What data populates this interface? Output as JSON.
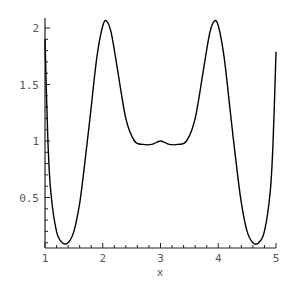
{
  "chart_data": {
    "type": "line",
    "title": "",
    "xlabel": "x",
    "ylabel": "",
    "xlim": [
      1,
      5
    ],
    "ylim": [
      0.05,
      2.1
    ],
    "grid": false,
    "legend": null,
    "x_ticks": [
      "1",
      "2",
      "3",
      "4",
      "5"
    ],
    "y_ticks": [
      "0.5",
      "1",
      "1.5",
      "2"
    ],
    "series": [
      {
        "name": "f(x)",
        "color": "#000000",
        "x": [
          1.0,
          1.05,
          1.1,
          1.2,
          1.3,
          1.4,
          1.5,
          1.6,
          1.7,
          1.8,
          1.9,
          2.0,
          2.07,
          2.15,
          2.25,
          2.4,
          2.55,
          2.7,
          2.85,
          3.0,
          3.15,
          3.3,
          3.45,
          3.6,
          3.75,
          3.85,
          3.93,
          4.0,
          4.1,
          4.2,
          4.3,
          4.4,
          4.5,
          4.6,
          4.7,
          4.8,
          4.9,
          4.95,
          5.0
        ],
        "y": [
          1.9,
          1.0,
          0.55,
          0.2,
          0.1,
          0.1,
          0.2,
          0.45,
          0.85,
          1.3,
          1.75,
          2.02,
          2.06,
          1.95,
          1.65,
          1.2,
          1.0,
          0.97,
          0.97,
          1.0,
          0.97,
          0.97,
          1.0,
          1.2,
          1.65,
          1.95,
          2.06,
          2.02,
          1.75,
          1.3,
          0.85,
          0.45,
          0.2,
          0.1,
          0.1,
          0.2,
          0.55,
          1.0,
          1.79
        ]
      }
    ]
  }
}
